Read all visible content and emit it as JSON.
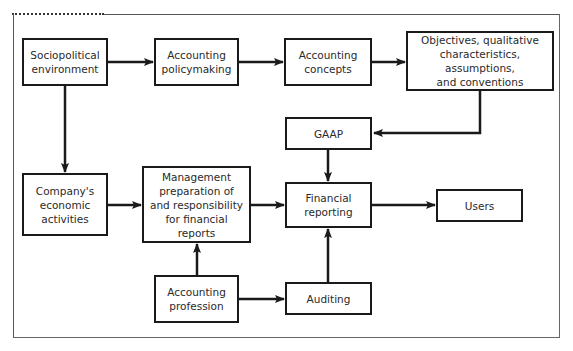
{
  "diagram": {
    "type": "flowchart",
    "nodes": {
      "sociopolitical": "Sociopolitical\nenvironment",
      "policymaking": "Accounting\npolicymaking",
      "concepts": "Accounting\nconcepts",
      "objectives": "Objectives, qualitative\ncharacteristics, assumptions,\nand conventions",
      "gaap": "GAAP",
      "company": "Company's\neconomic\nactivities",
      "management": "Management\npreparation of\nand responsibility\nfor financial reports",
      "financial_reporting": "Financial\nreporting",
      "users": "Users",
      "profession": "Accounting\nprofession",
      "auditing": "Auditing"
    },
    "edges": [
      {
        "from": "sociopolitical",
        "to": "policymaking"
      },
      {
        "from": "policymaking",
        "to": "concepts"
      },
      {
        "from": "concepts",
        "to": "objectives"
      },
      {
        "from": "objectives",
        "to": "gaap"
      },
      {
        "from": "sociopolitical",
        "to": "company"
      },
      {
        "from": "gaap",
        "to": "financial_reporting"
      },
      {
        "from": "company",
        "to": "management"
      },
      {
        "from": "management",
        "to": "financial_reporting"
      },
      {
        "from": "financial_reporting",
        "to": "users"
      },
      {
        "from": "profession",
        "to": "management"
      },
      {
        "from": "profession",
        "to": "auditing"
      },
      {
        "from": "auditing",
        "to": "financial_reporting"
      }
    ]
  }
}
